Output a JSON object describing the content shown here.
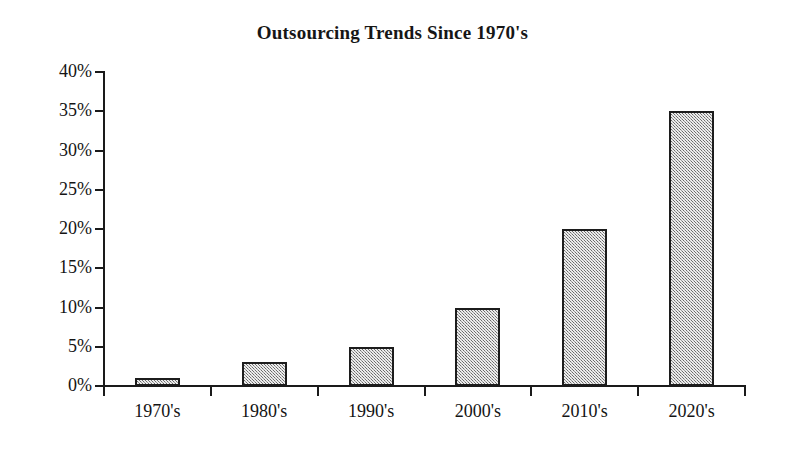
{
  "chart_data": {
    "type": "bar",
    "title": "Outsourcing Trends Since 1970's",
    "xlabel": "",
    "ylabel": "",
    "categories": [
      "1970's",
      "1980's",
      "1990's",
      "2000's",
      "2010's",
      "2020's"
    ],
    "values": [
      1,
      3,
      5,
      10,
      20,
      35
    ],
    "value_labels": [
      "1%",
      "3%",
      "5%",
      "10%",
      "20%",
      "35%"
    ],
    "ylim": [
      0,
      40
    ],
    "ytick_values": [
      0,
      5,
      10,
      15,
      20,
      25,
      30,
      35,
      40
    ],
    "ytick_labels": [
      "0%",
      "5%",
      "10%",
      "15%",
      "20%",
      "25%",
      "30%",
      "35%",
      "40%"
    ],
    "grid": false,
    "legend": null,
    "legend_position": "none",
    "series": [
      {
        "name": "Outsourcing",
        "values": [
          1,
          3,
          5,
          10,
          20,
          35
        ]
      }
    ],
    "colors": {
      "bar_fill": "#9c9c9c",
      "bar_border": "#1c1c1c",
      "axis": "#1a1a1a",
      "text": "#141414",
      "background": "#ffffff"
    }
  }
}
